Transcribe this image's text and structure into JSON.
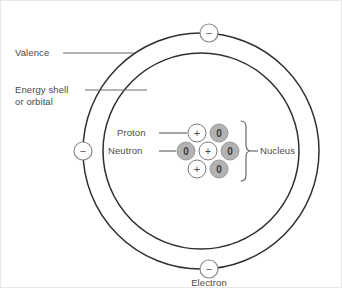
{
  "diagram": {
    "center": {
      "x": 200,
      "y": 150
    },
    "rings": [
      {
        "name": "valence-shell",
        "radius": 118,
        "label": "Valence"
      },
      {
        "name": "energy-shell",
        "radius": 98,
        "label": "Energy shell"
      }
    ],
    "labels": {
      "valence": "Valence",
      "energy_shell_line1": "Energy shell",
      "energy_shell_line2": "or orbital",
      "proton": "Proton",
      "neutron": "Neutron",
      "nucleus": "Nucleus",
      "electron": "Electron"
    },
    "electrons": [
      {
        "name": "electron-top",
        "x": 208,
        "y": 32,
        "glyph": "−"
      },
      {
        "name": "electron-left",
        "x": 82,
        "y": 150,
        "glyph": "−"
      },
      {
        "name": "electron-bottom",
        "x": 208,
        "y": 268,
        "glyph": "−"
      }
    ],
    "electron_label_position": {
      "x": 208,
      "y": 282
    },
    "nucleus_particles": [
      {
        "name": "proton-top",
        "type": "proton",
        "x": 196,
        "y": 132,
        "glyph": "+"
      },
      {
        "name": "neutron-top-right",
        "type": "neutron",
        "x": 218,
        "y": 132,
        "glyph": "0"
      },
      {
        "name": "neutron-left",
        "type": "neutron",
        "x": 185,
        "y": 150,
        "glyph": "0"
      },
      {
        "name": "proton-center",
        "type": "proton",
        "x": 207,
        "y": 150,
        "glyph": "+"
      },
      {
        "name": "neutron-right",
        "type": "neutron",
        "x": 229,
        "y": 150,
        "glyph": "0"
      },
      {
        "name": "proton-bottom",
        "type": "proton",
        "x": 196,
        "y": 168,
        "glyph": "+"
      },
      {
        "name": "neutron-bottom",
        "type": "neutron",
        "x": 218,
        "y": 168,
        "glyph": "0"
      }
    ],
    "particle_radius": 9,
    "electron_radius": 9,
    "colors": {
      "ring_stroke": "#2f2f2f",
      "leader_line": "#6a6a6a",
      "proton_fill": "#ffffff",
      "proton_stroke": "#7a7a7a",
      "neutron_fill": "#b2b2b2",
      "neutron_stroke": "#9a9a9a",
      "electron_fill": "#ffffff",
      "electron_stroke": "#8a8a8a",
      "text": "#4a4a4a",
      "background": "#ffffff"
    },
    "counts": {
      "protons": 3,
      "neutrons": 4,
      "electrons": 3
    }
  }
}
